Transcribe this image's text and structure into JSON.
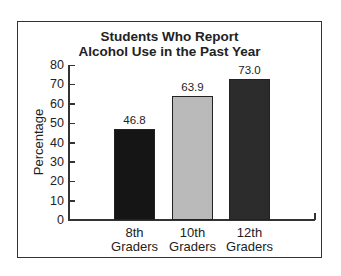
{
  "chart_data": {
    "type": "bar",
    "title": "Students Who Report Alcohol Use in the Past Year",
    "title_lines": [
      "Students Who Report",
      "Alcohol Use in the Past Year"
    ],
    "xlabel": "",
    "ylabel": "Percentage",
    "categories": [
      "8th Graders",
      "10th Graders",
      "12th Graders"
    ],
    "category_lines": [
      [
        "8th",
        "Graders"
      ],
      [
        "10th",
        "Graders"
      ],
      [
        "12th",
        "Graders"
      ]
    ],
    "values": [
      46.8,
      63.9,
      73.0
    ],
    "value_labels": [
      "46.8",
      "63.9",
      "73.0"
    ],
    "ylim": [
      0,
      80
    ],
    "yticks": [
      "0",
      "10",
      "20",
      "30",
      "40",
      "50",
      "60",
      "70",
      "80"
    ],
    "grid": false,
    "legend": null,
    "bar_colors": [
      "#151515",
      "#d4d4d4",
      "#555555"
    ]
  }
}
